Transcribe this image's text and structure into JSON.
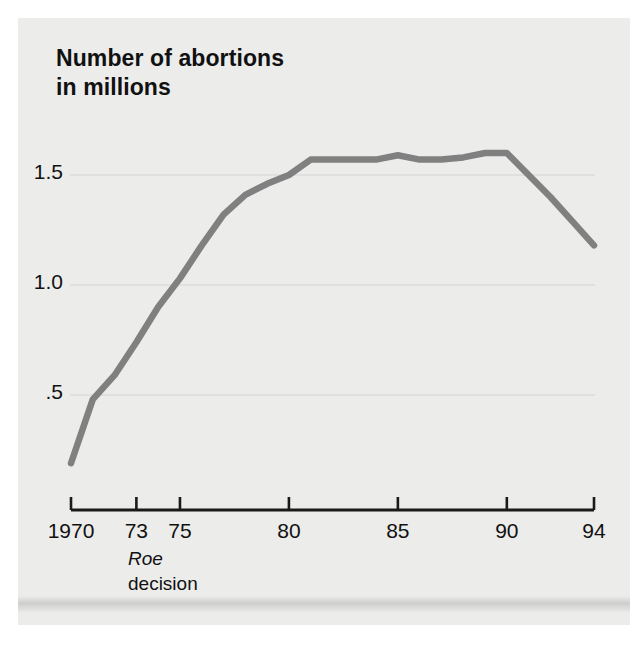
{
  "figure": {
    "title": "Number of abortions\nin millions",
    "background_color": "#ececeb",
    "line_color": "#808080",
    "text_color": "#111111",
    "gridline_color": "#dcdcda",
    "axis_color": "#1a1a1a"
  },
  "annotation": {
    "line1": "Roe",
    "line2": "decision"
  },
  "chart_data": {
    "type": "line",
    "title": "Number of abortions in millions",
    "xlabel": "",
    "ylabel": "Number of abortions in millions",
    "x": [
      1970,
      1971,
      1972,
      1973,
      1974,
      1975,
      1976,
      1977,
      1978,
      1979,
      1980,
      1981,
      1982,
      1983,
      1984,
      1985,
      1986,
      1987,
      1988,
      1989,
      1990,
      1991,
      1992,
      1993,
      1994
    ],
    "values": [
      0.19,
      0.48,
      0.59,
      0.74,
      0.9,
      1.03,
      1.18,
      1.32,
      1.41,
      1.46,
      1.5,
      1.57,
      1.57,
      1.57,
      1.57,
      1.59,
      1.57,
      1.57,
      1.58,
      1.6,
      1.6,
      1.5,
      1.4,
      1.29,
      1.18
    ],
    "xlim": [
      1970,
      1994
    ],
    "ylim": [
      0,
      1.75
    ],
    "xticks": [
      1970,
      1973,
      1975,
      1980,
      1985,
      1990,
      1994
    ],
    "xtick_labels": [
      "1970",
      "73",
      "75",
      "80",
      "85",
      "90",
      "94"
    ],
    "yticks": [
      0.5,
      1.0,
      1.5
    ],
    "ytick_labels": [
      ".5",
      "1.0",
      "1.5"
    ],
    "grid": "horizontal",
    "legend": "none",
    "annotations": [
      {
        "x": 1973,
        "text": "Roe decision",
        "position": "below-axis"
      }
    ]
  }
}
